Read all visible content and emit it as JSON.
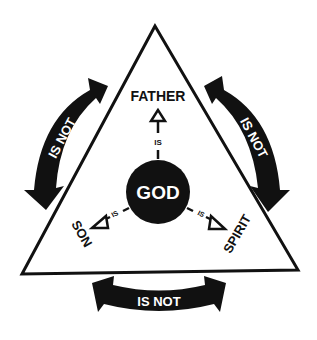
{
  "diagram": {
    "center": {
      "label": "GOD"
    },
    "persons": {
      "top": "FATHER",
      "left": "SON",
      "right": "SPIRIT"
    },
    "relations": {
      "is_top": "IS",
      "is_left": "IS",
      "is_right": "IS",
      "is_not_left": "IS NOT",
      "is_not_right": "IS NOT",
      "is_not_bottom": "IS NOT"
    },
    "colors": {
      "ink": "#111111",
      "background": "#ffffff",
      "center_text": "#ffffff"
    }
  }
}
